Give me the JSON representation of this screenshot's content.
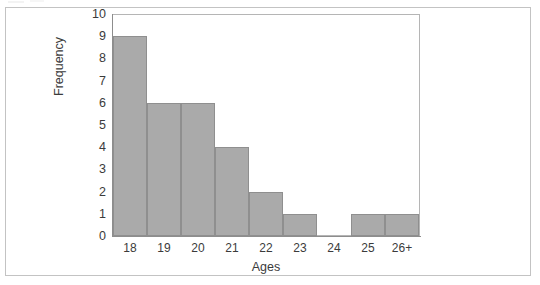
{
  "figure": {
    "frame_color": "#c3c3c3",
    "plot_border_color": "#b5b5b5",
    "axis_color": "#8d8d8d",
    "background": "#ffffff"
  },
  "chart_data": {
    "type": "bar",
    "title": "",
    "subtitle": "",
    "xlabel": "Ages",
    "ylabel": "Frequency",
    "categories": [
      "18",
      "19",
      "20",
      "21",
      "22",
      "23",
      "24",
      "25",
      "26+"
    ],
    "values": [
      9,
      6,
      6,
      4,
      2,
      1,
      0,
      1,
      1
    ],
    "ylim": [
      0,
      10
    ],
    "ytick_labels": [
      "10",
      "9",
      "8",
      "7",
      "6",
      "5",
      "4",
      "3",
      "2",
      "1",
      "0"
    ],
    "ytick_values": [
      10,
      9,
      8,
      7,
      6,
      5,
      4,
      3,
      2,
      1,
      0
    ],
    "ytick_step": 1,
    "grid": false,
    "legend": false,
    "legend_position": "none",
    "bar_fill": "#aaaaaa",
    "bar_edge": "#8f8f8f",
    "bars_adjacent": true,
    "annotations": []
  }
}
